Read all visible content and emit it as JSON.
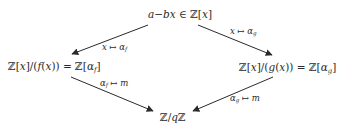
{
  "diagram": {
    "type": "commutative-diagram",
    "nodes": {
      "top": {
        "text": "a−bx ∈ ℤ[x]"
      },
      "left": {
        "text": "ℤ[x]/(f(x)) = ℤ[α_f]"
      },
      "right": {
        "text": "ℤ[x]/(g(x)) = ℤ[α_g]"
      },
      "bottom": {
        "text": "ℤ/qℤ"
      }
    },
    "edges": [
      {
        "from": "top",
        "to": "left",
        "label": "x ↦ α_f"
      },
      {
        "from": "top",
        "to": "right",
        "label": "x ↦ α_g"
      },
      {
        "from": "left",
        "to": "bottom",
        "label": "α_f ↦ m"
      },
      {
        "from": "right",
        "to": "bottom",
        "label": "α_g ↦ m"
      }
    ],
    "parts": {
      "top_a": "a",
      "top_minus": "−",
      "top_bx": "bx",
      "top_in": " ∈ ",
      "Z": "ℤ",
      "open_br": "[",
      "close_br": "]",
      "x": "x",
      "slash": "/",
      "f": "f",
      "g": "g",
      "paren_open": "(",
      "paren_close": ")",
      "eq": " = ",
      "alpha": "α",
      "sub_f": "f",
      "sub_g": "g",
      "mapsto": " ↦ ",
      "m": "m",
      "q": "q"
    },
    "colors": {
      "ink": "#2a2a2a",
      "background": "#ffffff"
    }
  }
}
